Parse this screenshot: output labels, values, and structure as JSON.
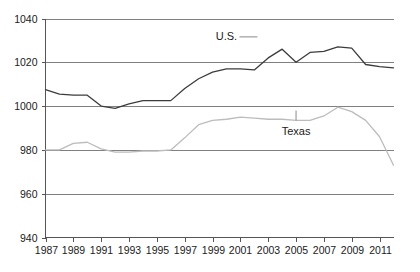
{
  "chart_data": {
    "type": "line",
    "title": "",
    "subtitle": "",
    "xlabel": "",
    "ylabel": "",
    "xlim": [
      1987,
      2012
    ],
    "ylim": [
      940,
      1040
    ],
    "ytick_values": [
      940,
      960,
      980,
      1000,
      1020,
      1040
    ],
    "ytick_labels": [
      "940",
      "960",
      "980",
      "1000",
      "1020",
      "1040"
    ],
    "xtick_values": [
      1987,
      1989,
      1991,
      1993,
      1995,
      1997,
      1999,
      2001,
      2003,
      2005,
      2007,
      2009,
      2011
    ],
    "xtick_labels": [
      "1987",
      "1989",
      "1991",
      "1993",
      "1995",
      "1997",
      "1999",
      "2001",
      "2003",
      "2005",
      "2007",
      "2009",
      "2011"
    ],
    "grid": true,
    "grid_axis": "y",
    "legend_position": "inline-annotation",
    "x": [
      1987,
      1988,
      1989,
      1990,
      1991,
      1992,
      1993,
      1994,
      1995,
      1996,
      1997,
      1998,
      1999,
      2000,
      2001,
      2002,
      2003,
      2004,
      2005,
      2006,
      2007,
      2008,
      2009,
      2010,
      2011,
      2012
    ],
    "series": [
      {
        "name": "U.S.",
        "color": "#3c3c3c",
        "label_x": 2000,
        "label_y": 1030,
        "values": [
          1007.5,
          1005.5,
          1005.0,
          1005.0,
          1000.0,
          999.0,
          1001.0,
          1002.5,
          1002.5,
          1002.5,
          1008.0,
          1012.5,
          1015.5,
          1017.0,
          1017.0,
          1016.5,
          1022.0,
          1026.0,
          1020.0,
          1024.5,
          1025.0,
          1027.0,
          1026.5,
          1019.0,
          1018.0,
          1017.5
        ]
      },
      {
        "name": "Texas",
        "color": "#bcbcbc",
        "label_x": 2005,
        "label_y": 987,
        "values": [
          980.0,
          980.0,
          983.0,
          983.5,
          980.5,
          979.0,
          979.0,
          979.5,
          979.5,
          980.0,
          985.5,
          991.5,
          993.5,
          994.0,
          995.0,
          994.5,
          994.0,
          994.0,
          993.5,
          993.5,
          995.5,
          999.5,
          997.5,
          993.5,
          986.0,
          973.0
        ]
      }
    ],
    "annotations": [
      {
        "text": "U.S.",
        "series": "U.S."
      },
      {
        "text": "Texas",
        "series": "Texas"
      }
    ]
  },
  "axes": {
    "y_axis_name": "y-axis",
    "x_axis_name": "x-axis"
  }
}
